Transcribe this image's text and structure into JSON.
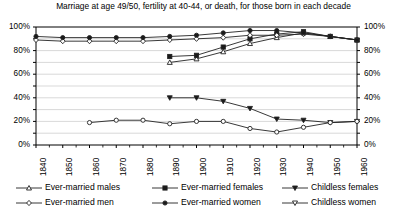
{
  "chart_data": {
    "type": "line",
    "title": "Marriage at age 49/50, fertility at 40-44, or death, for those born in each decade",
    "xlabel": "",
    "ylabel": "",
    "ylim": [
      0,
      100
    ],
    "ytick_labels": [
      "100%",
      "80%",
      "60%",
      "40%",
      "20%",
      "0%"
    ],
    "ytick_values": [
      100,
      80,
      60,
      40,
      20,
      0
    ],
    "right_axis": true,
    "right_ytick_labels": [
      "100%",
      "80%",
      "60%",
      "40%",
      "20%",
      "0%"
    ],
    "minor_gridlines": true,
    "grid": true,
    "legend_position": "bottom",
    "categories": [
      1840,
      1850,
      1860,
      1870,
      1880,
      1890,
      1900,
      1910,
      1920,
      1930,
      1940,
      1950,
      1960
    ],
    "xtick_labels": [
      "1840",
      "1850",
      "1860",
      "1870",
      "1880",
      "1890",
      "1900",
      "1910",
      "1920",
      "1930",
      "1940",
      "1950",
      "1960"
    ],
    "series": [
      {
        "name": "Ever-married males",
        "marker": "triangle-open",
        "filled": false,
        "x": [
          1890,
          1900,
          1910,
          1920,
          1930,
          1940,
          1950,
          1960
        ],
        "values": [
          70,
          73,
          79,
          86,
          91,
          95,
          92,
          89
        ]
      },
      {
        "name": "Ever-married females",
        "marker": "square-filled",
        "filled": true,
        "x": [
          1890,
          1900,
          1910,
          1920,
          1930,
          1940,
          1950,
          1960
        ],
        "values": [
          75,
          76,
          83,
          90,
          94,
          96,
          92,
          89
        ]
      },
      {
        "name": "Childless females",
        "marker": "triangle-down-filled",
        "filled": true,
        "x": [
          1890,
          1900,
          1910,
          1920,
          1930,
          1940,
          1950,
          1960
        ],
        "values": [
          40,
          40,
          37,
          31,
          22,
          21,
          19,
          20
        ]
      },
      {
        "name": "Ever-married men",
        "marker": "diamond-open",
        "filled": false,
        "x": [
          1840,
          1850,
          1860,
          1870,
          1880,
          1890,
          1900,
          1910,
          1920,
          1930,
          1940,
          1950,
          1960
        ],
        "values": [
          89,
          88,
          88,
          88,
          88,
          89,
          90,
          91,
          93,
          93,
          94,
          92,
          89
        ]
      },
      {
        "name": "Ever-married women",
        "marker": "circle-filled",
        "filled": true,
        "x": [
          1840,
          1850,
          1860,
          1870,
          1880,
          1890,
          1900,
          1910,
          1920,
          1930,
          1940,
          1950,
          1960
        ],
        "values": [
          92,
          91,
          91,
          91,
          91,
          92,
          93,
          95,
          97,
          97,
          95,
          92,
          89
        ]
      },
      {
        "name": "Childless women",
        "marker": "circle-open",
        "filled": false,
        "x": [
          1860,
          1870,
          1880,
          1890,
          1900,
          1910,
          1920,
          1930,
          1940,
          1950,
          1960
        ],
        "values": [
          19,
          21,
          21,
          18,
          20,
          20,
          14,
          11,
          15,
          19,
          20
        ]
      }
    ]
  },
  "legend": {
    "rows": [
      [
        {
          "label": "Ever-married males",
          "marker": "triangle-open"
        },
        {
          "label": "Ever-married females",
          "marker": "square-filled"
        },
        {
          "label": "Childless females",
          "marker": "triangle-down-filled"
        }
      ],
      [
        {
          "label": "Ever-married men",
          "marker": "diamond-open"
        },
        {
          "label": "Ever-married women",
          "marker": "circle-filled"
        },
        {
          "label": "Childless women",
          "marker": "triangle-down-open"
        }
      ]
    ]
  },
  "colors": {
    "line": "#222222",
    "grid": "#c8c8c8",
    "axis": "#000000",
    "background": "#ffffff"
  }
}
